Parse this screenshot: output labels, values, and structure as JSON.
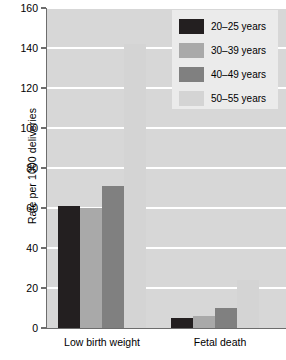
{
  "chart_data": {
    "type": "bar",
    "title": "",
    "subtitle": "",
    "xlabel": "",
    "ylabel": "Rate per 1000 deliveries",
    "categories": [
      "Low birth weight",
      "Fetal death"
    ],
    "ylim": [
      0,
      160
    ],
    "yticks": [
      0,
      20,
      40,
      60,
      80,
      100,
      120,
      140,
      160
    ],
    "ytick_labels": [
      "0",
      "20",
      "40",
      "60",
      "80",
      "100",
      "120",
      "140",
      "160"
    ],
    "grid": "horizontal-white",
    "legend_position": "top-right",
    "series": [
      {
        "name": "20–25 years",
        "color": "#231f20",
        "values": [
          61,
          5
        ]
      },
      {
        "name": "30–39 years",
        "color": "#a9a9a9",
        "values": [
          60,
          6
        ]
      },
      {
        "name": "40–49 years",
        "color": "#808080",
        "values": [
          71,
          10
        ]
      },
      {
        "name": "50–55 years",
        "color": "#d4d4d4",
        "values": [
          142,
          24
        ]
      }
    ]
  },
  "axis": {
    "y_title": "Rate per 1000 deliveries",
    "tick_160": "160",
    "tick_140": "140",
    "tick_120": "120",
    "tick_100": "100",
    "tick_80": "80",
    "tick_60": "60",
    "tick_40": "40",
    "tick_20": "20",
    "tick_0": "0"
  },
  "categories": {
    "cat0": "Low birth weight",
    "cat1": "Fetal death"
  },
  "legend": {
    "items": [
      {
        "label": "20–25 years",
        "color": "#231f20"
      },
      {
        "label": "30–39 years",
        "color": "#a9a9a9"
      },
      {
        "label": "40–49 years",
        "color": "#808080"
      },
      {
        "label": "50–55 years",
        "color": "#d4d4d4"
      }
    ]
  },
  "colors": {
    "plot_background": "#d7d7d7",
    "page_background": "#ffffff",
    "gridline": "#ffffff",
    "axis": "#6d6d6d",
    "legend_background": "#ebebeb"
  }
}
